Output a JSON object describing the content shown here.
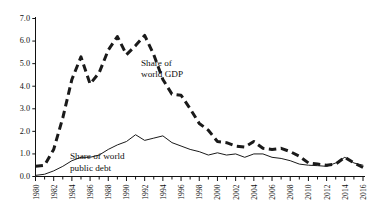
{
  "chart_data": {
    "type": "line",
    "title": "",
    "subtitle": "",
    "xlabel": "",
    "ylabel": "",
    "xlim": [
      1980,
      2016
    ],
    "ylim": [
      0.0,
      7.0
    ],
    "grid": false,
    "legend_position": "inline-annotation",
    "y_ticks": [
      "0.0",
      "1.0",
      "2.0",
      "3.0",
      "4.0",
      "5.0",
      "6.0",
      "7.0"
    ],
    "y_tick_values": [
      0.0,
      1.0,
      2.0,
      3.0,
      4.0,
      5.0,
      6.0,
      7.0
    ],
    "x_tick_labels": [
      "1980",
      "1982",
      "1984",
      "1986",
      "1988",
      "1990",
      "1992",
      "1994",
      "1996",
      "1998",
      "2000",
      "2002",
      "2004",
      "2006",
      "2008",
      "2010",
      "2012",
      "2014",
      "2016"
    ],
    "x_tick_values": [
      1980,
      1982,
      1984,
      1986,
      1988,
      1990,
      1992,
      1994,
      1996,
      1998,
      2000,
      2002,
      2004,
      2006,
      2008,
      2010,
      2012,
      2014,
      2016
    ],
    "x": [
      1980,
      1981,
      1982,
      1983,
      1984,
      1985,
      1986,
      1987,
      1988,
      1989,
      1990,
      1991,
      1992,
      1993,
      1994,
      1995,
      1996,
      1997,
      1998,
      1999,
      2000,
      2001,
      2002,
      2003,
      2004,
      2005,
      2006,
      2007,
      2008,
      2009,
      2010,
      2011,
      2012,
      2013,
      2014,
      2015,
      2016
    ],
    "series": [
      {
        "name": "Share of world GDP",
        "style": "dashed",
        "color": "#1a1a1a",
        "annotation": "Share of\nworld GDP",
        "values": [
          0.45,
          0.5,
          1.2,
          2.6,
          4.3,
          5.3,
          4.1,
          4.6,
          5.6,
          6.2,
          5.4,
          5.8,
          6.25,
          5.4,
          4.3,
          3.65,
          3.6,
          3.0,
          2.35,
          2.05,
          1.55,
          1.5,
          1.35,
          1.3,
          1.55,
          1.25,
          1.2,
          1.25,
          1.1,
          0.9,
          0.6,
          0.55,
          0.5,
          0.55,
          0.85,
          0.6,
          0.4
        ]
      },
      {
        "name": "Share of world public debt",
        "style": "solid",
        "color": "#1a1a1a",
        "annotation": "Share of world\npublic debt",
        "values": [
          0.05,
          0.1,
          0.25,
          0.45,
          0.7,
          0.85,
          0.85,
          0.95,
          1.2,
          1.4,
          1.55,
          1.85,
          1.6,
          1.7,
          1.8,
          1.5,
          1.35,
          1.2,
          1.1,
          0.95,
          1.05,
          0.95,
          1.0,
          0.85,
          1.0,
          1.0,
          0.85,
          0.8,
          0.7,
          0.55,
          0.5,
          0.48,
          0.45,
          0.6,
          0.85,
          0.6,
          0.5
        ]
      }
    ],
    "annotations": [
      {
        "name": "gdp-annotation",
        "line1": "Share of",
        "line2": "world GDP"
      },
      {
        "name": "debt-annotation",
        "line1": "Share of world",
        "line2": "public debt"
      }
    ]
  }
}
